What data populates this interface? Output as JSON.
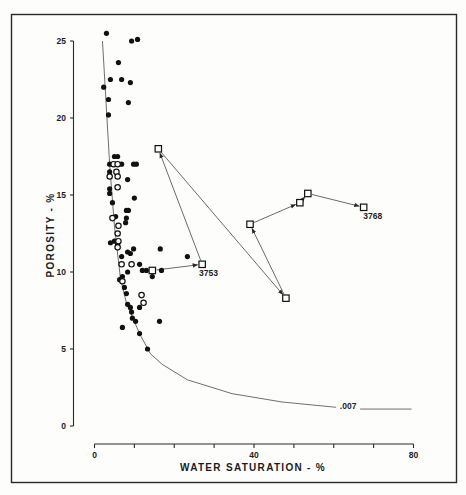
{
  "figure": {
    "y_axis_title": "POROSITY - %",
    "x_axis_title": "WATER SATURATION - %"
  },
  "chart_data": {
    "type": "scatter",
    "title": "",
    "xlabel": "WATER SATURATION - %",
    "ylabel": "POROSITY - %",
    "xlim": [
      0,
      80
    ],
    "ylim": [
      0,
      25
    ],
    "grid": false,
    "legend": null,
    "x_axis": {
      "ticks": [
        0,
        10,
        20,
        30,
        40,
        50,
        60,
        70,
        80
      ],
      "tick_labels": [
        {
          "value": 0,
          "text": "0"
        },
        {
          "value": 40,
          "text": "40"
        },
        {
          "value": 80,
          "text": "80"
        }
      ]
    },
    "y_axis": {
      "ticks": [
        0,
        5,
        10,
        15,
        20,
        25
      ],
      "tick_labels": [
        "0",
        "5",
        "10",
        "15",
        "20",
        "25"
      ]
    },
    "series": [
      {
        "name": "filled-circles",
        "marker": "filled-circle",
        "points": [
          [
            3.0,
            25.5
          ],
          [
            9.3,
            25.0
          ],
          [
            10.8,
            25.1
          ],
          [
            6.0,
            23.6
          ],
          [
            4.0,
            22.5
          ],
          [
            6.8,
            22.5
          ],
          [
            9.0,
            22.3
          ],
          [
            2.3,
            22.0
          ],
          [
            3.5,
            21.2
          ],
          [
            8.5,
            21.0
          ],
          [
            3.5,
            20.2
          ],
          [
            5.8,
            17.5
          ],
          [
            5.0,
            17.5
          ],
          [
            3.8,
            17.0
          ],
          [
            6.8,
            17.0
          ],
          [
            9.8,
            17.0
          ],
          [
            10.5,
            17.0
          ],
          [
            3.8,
            16.5
          ],
          [
            8.3,
            16.0
          ],
          [
            3.8,
            15.4
          ],
          [
            3.8,
            15.1
          ],
          [
            10.0,
            14.8
          ],
          [
            4.5,
            14.5
          ],
          [
            8.0,
            14.0
          ],
          [
            8.5,
            14.0
          ],
          [
            5.3,
            13.6
          ],
          [
            8.0,
            13.5
          ],
          [
            7.8,
            13.2
          ],
          [
            4.0,
            11.9
          ],
          [
            5.0,
            12.0
          ],
          [
            5.8,
            11.8
          ],
          [
            8.3,
            11.3
          ],
          [
            9.0,
            11.2
          ],
          [
            9.8,
            11.5
          ],
          [
            16.5,
            11.5
          ],
          [
            6.8,
            11.0
          ],
          [
            23.3,
            11.0
          ],
          [
            11.3,
            10.5
          ],
          [
            12.0,
            10.1
          ],
          [
            13.0,
            10.1
          ],
          [
            16.8,
            10.1
          ],
          [
            14.5,
            9.7
          ],
          [
            8.3,
            10.0
          ],
          [
            7.0,
            9.7
          ],
          [
            6.3,
            9.5
          ],
          [
            7.5,
            9.0
          ],
          [
            8.0,
            8.6
          ],
          [
            8.3,
            7.9
          ],
          [
            9.0,
            7.7
          ],
          [
            11.3,
            7.7
          ],
          [
            9.3,
            7.4
          ],
          [
            9.5,
            7.0
          ],
          [
            10.3,
            6.8
          ],
          [
            16.3,
            6.8
          ],
          [
            7.0,
            6.4
          ],
          [
            11.3,
            6.0
          ],
          [
            13.3,
            5.0
          ]
        ]
      },
      {
        "name": "open-circles",
        "marker": "open-circle",
        "points": [
          [
            4.8,
            17.0
          ],
          [
            5.8,
            17.0
          ],
          [
            5.5,
            16.5
          ],
          [
            3.8,
            16.2
          ],
          [
            5.8,
            16.2
          ],
          [
            5.8,
            15.5
          ],
          [
            4.5,
            13.5
          ],
          [
            6.0,
            13.0
          ],
          [
            5.8,
            12.5
          ],
          [
            6.0,
            12.0
          ],
          [
            5.8,
            11.6
          ],
          [
            6.8,
            10.5
          ],
          [
            9.3,
            10.5
          ],
          [
            7.0,
            9.4
          ],
          [
            11.8,
            8.5
          ],
          [
            12.3,
            8.0
          ]
        ]
      },
      {
        "name": "square-path",
        "marker": "open-square",
        "connected": "arrows",
        "points": [
          [
            14.5,
            10.1
          ],
          [
            27.0,
            10.5
          ],
          [
            16.0,
            18.0
          ],
          [
            48.0,
            8.3
          ],
          [
            39.0,
            13.1
          ],
          [
            51.5,
            14.5
          ],
          [
            53.5,
            15.1
          ],
          [
            67.5,
            14.2
          ]
        ]
      },
      {
        "name": "cutoff-curve",
        "type": "line",
        "label": ".007",
        "points": [
          [
            2.0,
            25.0
          ],
          [
            3.8,
            17.0
          ],
          [
            5.0,
            13.0
          ],
          [
            6.5,
            9.6
          ],
          [
            8.0,
            8.0
          ],
          [
            11.3,
            6.0
          ],
          [
            14.0,
            4.7
          ],
          [
            17.0,
            4.0
          ],
          [
            23.3,
            3.0
          ],
          [
            34.5,
            2.1
          ],
          [
            47.0,
            1.56
          ],
          [
            60.0,
            1.23
          ],
          [
            66.0,
            1.1
          ],
          [
            79.5,
            1.1
          ]
        ]
      }
    ],
    "annotations": [
      {
        "text": "3753",
        "x": 28.6,
        "y": 9.75,
        "refers_to": "square-path point 2"
      },
      {
        "text": "3768",
        "x": 69.8,
        "y": 13.45,
        "refers_to": "square-path point 8"
      },
      {
        "text": ".007",
        "x": 63.6,
        "y": 1.08,
        "refers_to": "cutoff-curve"
      }
    ]
  }
}
